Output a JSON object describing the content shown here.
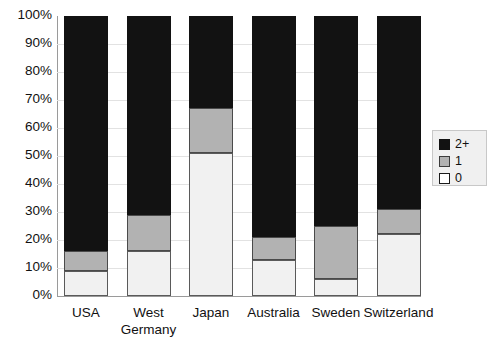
{
  "chart_data": {
    "type": "bar",
    "subtype": "stacked-percentage",
    "title": "",
    "xlabel": "",
    "ylabel": "",
    "ylim": [
      0,
      100
    ],
    "yticks": [
      "0%",
      "10%",
      "20%",
      "30%",
      "40%",
      "50%",
      "60%",
      "70%",
      "80%",
      "90%",
      "100%"
    ],
    "ytick_values": [
      0,
      10,
      20,
      30,
      40,
      50,
      60,
      70,
      80,
      90,
      100
    ],
    "grid": true,
    "legend_position": "right",
    "categories": [
      "USA",
      "West Germany",
      "Japan",
      "Australia",
      "Sweden",
      "Switzerland"
    ],
    "category_lines": [
      [
        "USA"
      ],
      [
        "West",
        "Germany"
      ],
      [
        "Japan"
      ],
      [
        "Australia"
      ],
      [
        "Sweden"
      ],
      [
        "Switzerland"
      ]
    ],
    "series": [
      {
        "name": "0",
        "color": "#f1f1f1",
        "values": [
          9,
          16,
          51,
          13,
          6,
          22
        ]
      },
      {
        "name": "1",
        "color": "#b2b2b2",
        "values": [
          7,
          13,
          16,
          8,
          19,
          9
        ]
      },
      {
        "name": "2+",
        "color": "#121212",
        "values": [
          84,
          71,
          33,
          79,
          75,
          69
        ]
      }
    ]
  },
  "legend": {
    "items": [
      {
        "label": "2+",
        "swatch": "black-square-icon"
      },
      {
        "label": "1",
        "swatch": "gray-square-icon"
      },
      {
        "label": "0",
        "swatch": "white-square-icon"
      }
    ]
  }
}
